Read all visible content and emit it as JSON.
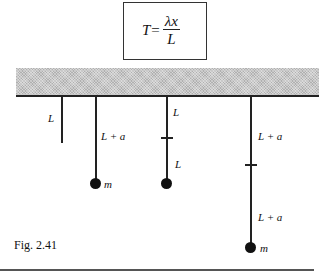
{
  "formula": {
    "lhs": "T",
    "equals": "=",
    "numerator": "λx",
    "denominator": "L"
  },
  "pendulums": [
    {
      "segments": [
        "L"
      ],
      "has_mass": false
    },
    {
      "segments": [
        "L + a"
      ],
      "has_mass": true,
      "mass_label": "m"
    },
    {
      "segments": [
        "L",
        "L"
      ],
      "has_mass": true,
      "mass_label": ""
    },
    {
      "segments": [
        "L + a",
        "L + a"
      ],
      "has_mass": true,
      "mass_label": "m"
    }
  ],
  "labels": {
    "p1_seg1": "L",
    "p2_seg1": "L + a",
    "p2_mass": "m",
    "p3_seg1": "L",
    "p3_seg2": "L",
    "p4_seg1": "L + a",
    "p4_seg2": "L + a",
    "p4_mass": "m"
  },
  "caption": "Fig. 2.41"
}
